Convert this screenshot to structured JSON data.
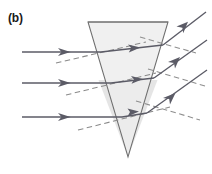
{
  "figure": {
    "panel_label": "(b)",
    "caption": "",
    "width": 212,
    "height": 174,
    "background_color": "#ffffff"
  },
  "colors": {
    "prism_fill": "#ededed",
    "prism_fill_lower": "#e4e4e4",
    "prism_stroke": "#6e6e6e",
    "ray_stroke": "#5b5b66",
    "normal_stroke": "#8a8a8a",
    "label_color": "#1a1a1a"
  },
  "chart_data": {
    "type": "diagram",
    "title": "(b)",
    "prism": {
      "name": "inverted-triangular-prism",
      "vertices": [
        {
          "x": 88,
          "y": 22
        },
        {
          "x": 168,
          "y": 22
        },
        {
          "x": 128,
          "y": 157
        }
      ],
      "apex_direction": "down",
      "fill": "#ededed",
      "stroke": "#6e6e6e"
    },
    "rays": [
      {
        "id": "ray-1",
        "incident": {
          "x1": 22,
          "y1": 52,
          "x2": 101,
          "y2": 52
        },
        "internal": {
          "x1": 101,
          "y1": 52,
          "x2": 163,
          "y2": 45
        },
        "emergent": {
          "x1": 163,
          "y1": 45,
          "x2": 206,
          "y2": 12
        },
        "normal": {
          "x1": 56,
          "y1": 63,
          "x2": 146,
          "y2": 42
        },
        "arrows": 3
      },
      {
        "id": "ray-2",
        "incident": {
          "x1": 22,
          "y1": 83,
          "x2": 111,
          "y2": 83
        },
        "internal": {
          "x1": 111,
          "y1": 83,
          "x2": 154,
          "y2": 78
        },
        "emergent": {
          "x1": 154,
          "y1": 78,
          "x2": 207,
          "y2": 40
        },
        "normal": {
          "x1": 66,
          "y1": 95,
          "x2": 156,
          "y2": 73
        },
        "arrows": 3
      },
      {
        "id": "ray-3",
        "incident": {
          "x1": 22,
          "y1": 117,
          "x2": 122,
          "y2": 117
        },
        "internal": {
          "x1": 122,
          "y1": 117,
          "x2": 147,
          "y2": 113
        },
        "emergent": {
          "x1": 147,
          "y1": 113,
          "x2": 207,
          "y2": 70
        },
        "normal": {
          "x1": 78,
          "y1": 130,
          "x2": 170,
          "y2": 107
        },
        "arrows": 3
      }
    ],
    "legend": [],
    "annotations": [
      {
        "text": "(b)",
        "x": 8,
        "y": 12,
        "role": "panel-label"
      }
    ]
  }
}
